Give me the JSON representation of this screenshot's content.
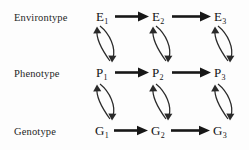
{
  "diagram": {
    "row_labels": [
      {
        "id": "environtype",
        "label": "Environtype"
      },
      {
        "id": "phenotype",
        "label": "Phenotype"
      },
      {
        "id": "genotype",
        "label": "Genotype"
      }
    ],
    "nodes": [
      {
        "id": "E1",
        "base": "E",
        "sub": "1",
        "row": "environtype",
        "col": 1
      },
      {
        "id": "E2",
        "base": "E",
        "sub": "2",
        "row": "environtype",
        "col": 2
      },
      {
        "id": "E3",
        "base": "E",
        "sub": "3",
        "row": "environtype",
        "col": 3
      },
      {
        "id": "P1",
        "base": "P",
        "sub": "1",
        "row": "phenotype",
        "col": 1
      },
      {
        "id": "P2",
        "base": "P",
        "sub": "2",
        "row": "phenotype",
        "col": 2
      },
      {
        "id": "P3",
        "base": "P",
        "sub": "3",
        "row": "phenotype",
        "col": 3
      },
      {
        "id": "G1",
        "base": "G",
        "sub": "1",
        "row": "genotype",
        "col": 1
      },
      {
        "id": "G2",
        "base": "G",
        "sub": "2",
        "row": "genotype",
        "col": 2
      },
      {
        "id": "G3",
        "base": "G",
        "sub": "3",
        "row": "genotype",
        "col": 3
      }
    ],
    "horizontal_edges": [
      {
        "from": "E1",
        "to": "E2",
        "style": "solid-arrow"
      },
      {
        "from": "E2",
        "to": "E3",
        "style": "solid-arrow"
      },
      {
        "from": "P1",
        "to": "P2",
        "style": "solid-arrow"
      },
      {
        "from": "P2",
        "to": "P3",
        "style": "solid-arrow"
      },
      {
        "from": "G1",
        "to": "G2",
        "style": "solid-arrow"
      },
      {
        "from": "G2",
        "to": "G3",
        "style": "solid-arrow"
      }
    ],
    "curved_edge_pairs": [
      {
        "upper": "E1",
        "lower": "P1",
        "style": "bidirectional-arc-pair"
      },
      {
        "upper": "E2",
        "lower": "P2",
        "style": "bidirectional-arc-pair"
      },
      {
        "upper": "E3",
        "lower": "P3",
        "style": "bidirectional-arc-pair"
      },
      {
        "upper": "P1",
        "lower": "G1",
        "style": "bidirectional-arc-pair"
      },
      {
        "upper": "P2",
        "lower": "G2",
        "style": "bidirectional-arc-pair"
      },
      {
        "upper": "P3",
        "lower": "G3",
        "style": "bidirectional-arc-pair"
      }
    ],
    "colors": {
      "background": "#fdfdfd",
      "text": "#141414",
      "label_text": "#262626",
      "horizontal_arrow": "#171717",
      "curved_arrow": "#2a2a2a"
    }
  }
}
